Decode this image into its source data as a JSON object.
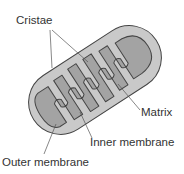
{
  "diagram": {
    "colors": {
      "outer_fill": "#c9c9c9",
      "inner_fill": "#a3a3a3",
      "outline": "#444444",
      "leader": "#555555"
    },
    "labels": {
      "cristae": "Cristae",
      "matrix": "Matrix",
      "inner_membrane": "Inner membrane",
      "outer_membrane": "Outer membrane"
    }
  }
}
